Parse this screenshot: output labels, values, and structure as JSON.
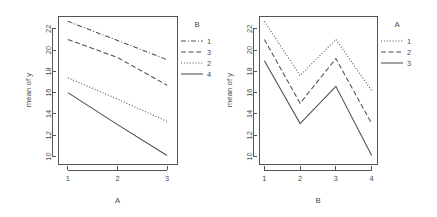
{
  "chart_data": [
    {
      "type": "line",
      "panel": "left",
      "title": "",
      "xlabel": "A",
      "ylabel": "mean of  y",
      "x": [
        1,
        2,
        3
      ],
      "xticklabels": [
        "1",
        "2",
        "3"
      ],
      "yticks": [
        10,
        12,
        14,
        16,
        18,
        20,
        22
      ],
      "yticklabels": [
        "10",
        "12",
        "14",
        "16",
        "18",
        "20",
        "22"
      ],
      "ylim": [
        9.3,
        23.2
      ],
      "xlim": [
        0.8,
        3.2
      ],
      "grid": false,
      "legend": {
        "title": "B",
        "position": "top-right-outside",
        "entries": [
          {
            "label": "1",
            "dash": "dashdot"
          },
          {
            "label": "3",
            "dash": "dashed"
          },
          {
            "label": "2",
            "dash": "dotted"
          },
          {
            "label": "4",
            "dash": "solid"
          }
        ]
      },
      "series": [
        {
          "name": "1",
          "dash": "dashdot",
          "values": [
            22.7,
            20.9,
            19.1
          ]
        },
        {
          "name": "3",
          "dash": "dashed",
          "values": [
            21.0,
            19.3,
            16.7
          ]
        },
        {
          "name": "2",
          "dash": "dotted",
          "values": [
            17.4,
            15.4,
            13.3
          ]
        },
        {
          "name": "4",
          "dash": "solid",
          "values": [
            16.0,
            13.0,
            10.1
          ]
        }
      ]
    },
    {
      "type": "line",
      "panel": "right",
      "title": "",
      "xlabel": "B",
      "ylabel": "mean of  y",
      "x": [
        1,
        2,
        3,
        4
      ],
      "xticklabels": [
        "1",
        "2",
        "3",
        "4"
      ],
      "yticks": [
        10,
        12,
        14,
        16,
        18,
        20,
        22
      ],
      "yticklabels": [
        "10",
        "12",
        "14",
        "16",
        "18",
        "20",
        "22"
      ],
      "ylim": [
        9.3,
        23.2
      ],
      "xlim": [
        0.85,
        4.15
      ],
      "grid": false,
      "legend": {
        "title": "A",
        "position": "top-right-outside",
        "entries": [
          {
            "label": "1",
            "dash": "dotted"
          },
          {
            "label": "2",
            "dash": "dashed"
          },
          {
            "label": "3",
            "dash": "solid"
          }
        ]
      },
      "series": [
        {
          "name": "1",
          "dash": "dotted",
          "values": [
            22.7,
            17.6,
            21.0,
            16.2
          ]
        },
        {
          "name": "2",
          "dash": "dashed",
          "values": [
            21.0,
            15.0,
            19.2,
            13.1
          ]
        },
        {
          "name": "3",
          "dash": "solid",
          "values": [
            19.0,
            13.1,
            16.6,
            10.1
          ]
        }
      ]
    }
  ],
  "colors": {
    "axis": "#555555",
    "line": "#4f4f4f",
    "text": "#4a4a4a",
    "background": "#ffffff"
  }
}
